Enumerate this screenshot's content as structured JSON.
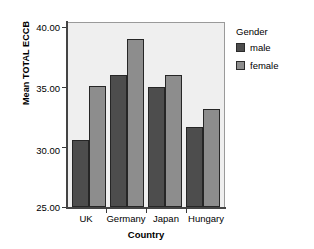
{
  "chart_data": {
    "type": "bar",
    "title": "",
    "xlabel": "Country",
    "ylabel": "Mean TOTAL ECCB",
    "categories": [
      "UK",
      "Germany",
      "Japan",
      "Hungary"
    ],
    "series": [
      {
        "name": "male",
        "color": "#4d4d4d",
        "values": [
          30.5,
          35.8,
          34.8,
          31.5
        ]
      },
      {
        "name": "female",
        "color": "#8d8d8d",
        "values": [
          34.9,
          38.7,
          35.8,
          33.0
        ]
      }
    ],
    "ylim": [
      25.0,
      40.0
    ],
    "yticks": [
      25.0,
      30.0,
      35.0,
      40.0
    ],
    "ytick_labels": [
      "25.00",
      "30.00",
      "35.00",
      "40.00"
    ],
    "grid": false,
    "legend_position": "right",
    "legend_title": "Gender",
    "plot_background": "#efefef",
    "figure_background": "#ffffff"
  },
  "legend": {
    "title": "Gender",
    "entries": [
      {
        "label": "male"
      },
      {
        "label": "female"
      }
    ]
  },
  "axes": {
    "y_title": "Mean TOTAL ECCB",
    "x_title": "Country",
    "y_labels": [
      "40.00",
      "35.00",
      "30.00",
      "25.00"
    ],
    "x_labels": [
      "UK",
      "Germany",
      "Japan",
      "Hungary"
    ]
  }
}
